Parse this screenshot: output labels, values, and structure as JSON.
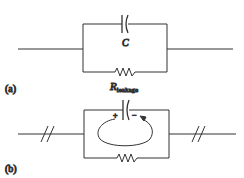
{
  "figure_a": {
    "label": "(a)",
    "capacitor_label": "C",
    "resistor_label_main": "R",
    "resistor_label_sub": "leakage"
  },
  "figure_b": {
    "label": "(b)",
    "plus": "+",
    "minus": "−"
  },
  "colors": {
    "line": "#333333"
  }
}
